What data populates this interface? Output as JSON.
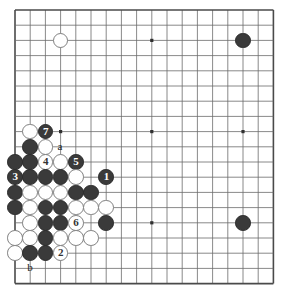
{
  "diagram": {
    "type": "go-board-diagram",
    "board": {
      "columns": 18,
      "rows": 19,
      "origin_x": 15,
      "origin_y": 10,
      "spacing": 15.2,
      "line_color": "#6b6b6b",
      "edge_color": "#4a4a4a",
      "background": "#ffffff",
      "star_points": [
        {
          "col": 10,
          "row": 3
        },
        {
          "col": 10,
          "row": 9
        },
        {
          "col": 10,
          "row": 15
        },
        {
          "col": 16,
          "row": 9
        },
        {
          "col": 4,
          "row": 9
        }
      ]
    },
    "colors": {
      "black_stone": "#3a3a3a",
      "white_stone": "#ffffff",
      "black_outline": "#2b2b2b",
      "white_outline": "#808080",
      "black_label": "#ffffff",
      "white_label": "#333333"
    },
    "stones": [
      {
        "col": 4,
        "row": 3,
        "color": "white",
        "label": ""
      },
      {
        "col": 16,
        "row": 3,
        "color": "black",
        "label": ""
      },
      {
        "col": 16,
        "row": 15,
        "color": "black",
        "label": ""
      },
      {
        "col": 2,
        "row": 9,
        "color": "white",
        "label": ""
      },
      {
        "col": 3,
        "row": 9,
        "color": "black",
        "label": "7"
      },
      {
        "col": 2,
        "row": 10,
        "color": "black",
        "label": ""
      },
      {
        "col": 3,
        "row": 10,
        "color": "white",
        "label": ""
      },
      {
        "col": 1,
        "row": 11,
        "color": "black",
        "label": ""
      },
      {
        "col": 2,
        "row": 11,
        "color": "black",
        "label": ""
      },
      {
        "col": 3,
        "row": 11,
        "color": "white",
        "label": "4"
      },
      {
        "col": 4,
        "row": 11,
        "color": "white",
        "label": ""
      },
      {
        "col": 5,
        "row": 11,
        "color": "black",
        "label": "5"
      },
      {
        "col": 1,
        "row": 12,
        "color": "black",
        "label": "3"
      },
      {
        "col": 2,
        "row": 12,
        "color": "black",
        "label": ""
      },
      {
        "col": 3,
        "row": 12,
        "color": "black",
        "label": ""
      },
      {
        "col": 4,
        "row": 12,
        "color": "black",
        "label": ""
      },
      {
        "col": 5,
        "row": 12,
        "color": "white",
        "label": ""
      },
      {
        "col": 7,
        "row": 12,
        "color": "black",
        "label": "1"
      },
      {
        "col": 1,
        "row": 13,
        "color": "black",
        "label": ""
      },
      {
        "col": 2,
        "row": 13,
        "color": "white",
        "label": ""
      },
      {
        "col": 3,
        "row": 13,
        "color": "white",
        "label": ""
      },
      {
        "col": 4,
        "row": 13,
        "color": "white",
        "label": ""
      },
      {
        "col": 5,
        "row": 13,
        "color": "black",
        "label": ""
      },
      {
        "col": 6,
        "row": 13,
        "color": "black",
        "label": ""
      },
      {
        "col": 1,
        "row": 14,
        "color": "black",
        "label": ""
      },
      {
        "col": 2,
        "row": 14,
        "color": "white",
        "label": ""
      },
      {
        "col": 3,
        "row": 14,
        "color": "black",
        "label": ""
      },
      {
        "col": 4,
        "row": 14,
        "color": "black",
        "label": ""
      },
      {
        "col": 5,
        "row": 14,
        "color": "white",
        "label": ""
      },
      {
        "col": 6,
        "row": 14,
        "color": "white",
        "label": ""
      },
      {
        "col": 7,
        "row": 14,
        "color": "white",
        "label": ""
      },
      {
        "col": 2,
        "row": 15,
        "color": "white",
        "label": ""
      },
      {
        "col": 3,
        "row": 15,
        "color": "black",
        "label": ""
      },
      {
        "col": 4,
        "row": 15,
        "color": "black",
        "label": ""
      },
      {
        "col": 5,
        "row": 15,
        "color": "white",
        "label": "6"
      },
      {
        "col": 7,
        "row": 15,
        "color": "black",
        "label": ""
      },
      {
        "col": 1,
        "row": 16,
        "color": "white",
        "label": ""
      },
      {
        "col": 2,
        "row": 16,
        "color": "white",
        "label": ""
      },
      {
        "col": 3,
        "row": 16,
        "color": "black",
        "label": ""
      },
      {
        "col": 4,
        "row": 16,
        "color": "white",
        "label": ""
      },
      {
        "col": 5,
        "row": 16,
        "color": "white",
        "label": ""
      },
      {
        "col": 6,
        "row": 16,
        "color": "white",
        "label": ""
      },
      {
        "col": 1,
        "row": 17,
        "color": "white",
        "label": ""
      },
      {
        "col": 2,
        "row": 17,
        "color": "black",
        "label": ""
      },
      {
        "col": 3,
        "row": 17,
        "color": "black",
        "label": ""
      },
      {
        "col": 4,
        "row": 17,
        "color": "white",
        "label": "2"
      }
    ],
    "point_labels": [
      {
        "id": "point-label-a",
        "text": "a",
        "col": 4,
        "row": 10
      },
      {
        "id": "point-label-b",
        "text": "b",
        "col": 2,
        "row": 18
      }
    ],
    "move_numbers": [
      "1",
      "2",
      "3",
      "4",
      "5",
      "6",
      "7"
    ]
  }
}
